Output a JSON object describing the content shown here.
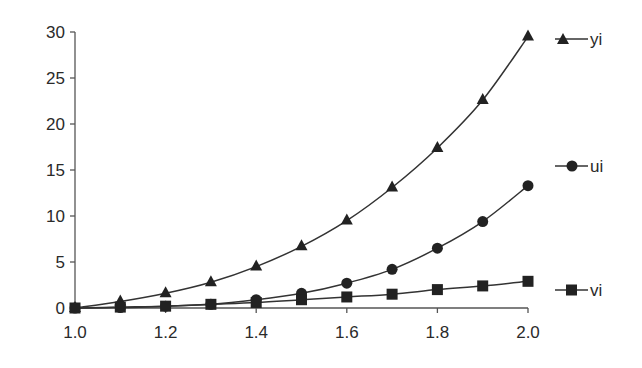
{
  "chart_data": {
    "type": "line",
    "title": "",
    "xlabel": "",
    "ylabel": "",
    "x": [
      1.0,
      1.1,
      1.2,
      1.3,
      1.4,
      1.5,
      1.6,
      1.7,
      1.8,
      1.9,
      2.0
    ],
    "series": [
      {
        "name": "yi",
        "marker": "triangle",
        "values": [
          0,
          0.7,
          1.6,
          2.8,
          4.5,
          6.7,
          9.5,
          13.1,
          17.4,
          22.6,
          29.5
        ]
      },
      {
        "name": "ui",
        "marker": "circle",
        "values": [
          0,
          0.05,
          0.2,
          0.4,
          0.9,
          1.6,
          2.7,
          4.2,
          6.5,
          9.4,
          13.3
        ]
      },
      {
        "name": "vi",
        "marker": "square",
        "values": [
          0,
          0.1,
          0.2,
          0.4,
          0.6,
          0.9,
          1.2,
          1.5,
          2.0,
          2.4,
          2.9
        ]
      }
    ],
    "xlim": [
      1.0,
      2.0
    ],
    "ylim": [
      0,
      30
    ],
    "xticks": [
      "1.0",
      "1.2",
      "1.4",
      "1.6",
      "1.8",
      "2.0"
    ],
    "yticks": [
      "0",
      "5",
      "10",
      "15",
      "20",
      "25",
      "30"
    ],
    "grid": false,
    "legend_position": "right",
    "colors": {
      "line": "#333333",
      "marker": "#222222",
      "axis": "#555555",
      "text": "#2a2a2a"
    }
  },
  "legend": {
    "items": [
      {
        "label": "yi",
        "marker": "triangle"
      },
      {
        "label": "ui",
        "marker": "circle"
      },
      {
        "label": "vi",
        "marker": "square"
      }
    ]
  }
}
